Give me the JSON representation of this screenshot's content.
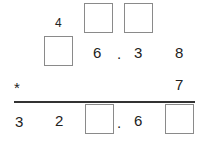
{
  "puzzle": {
    "row1": {
      "digit": "4",
      "blank_count": 2
    },
    "row2": {
      "digits": [
        "6",
        ".",
        "3",
        "8"
      ],
      "blank_count": 1
    },
    "operator_row": {
      "operator": "*",
      "multiplier": "7"
    },
    "result_row": {
      "digits": [
        "3",
        "2",
        ".",
        "6"
      ],
      "blank_count": 2
    }
  }
}
